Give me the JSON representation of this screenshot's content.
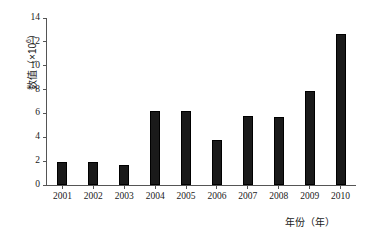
{
  "chart_data": {
    "type": "bar",
    "title": "",
    "categories": [
      "2001",
      "2002",
      "2003",
      "2004",
      "2005",
      "2006",
      "2007",
      "2008",
      "2009",
      "2010"
    ],
    "values": [
      1.9,
      1.9,
      1.7,
      6.2,
      6.2,
      3.8,
      5.8,
      5.7,
      7.9,
      12.7
    ],
    "xlabel": "年份（年）",
    "ylabel_text": "数值（×10",
    "ylabel_exponent": "6",
    "ylabel_tail": "）",
    "ylabel_full": "数值（×10⁶）",
    "ylim": [
      0,
      14
    ],
    "yticks": [
      "0",
      "2",
      "4",
      "6",
      "8",
      "10",
      "12",
      "14"
    ],
    "ytick_values": [
      0,
      2,
      4,
      6,
      8,
      10,
      12,
      14
    ],
    "grid": "off",
    "legend": "none",
    "bar_color": "#1a1a1a",
    "axis_color": "#555555",
    "background": "#ffffff"
  }
}
